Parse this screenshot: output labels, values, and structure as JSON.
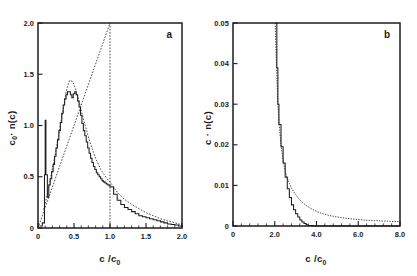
{
  "figure": {
    "background": "#ffffff",
    "ink_color": "#1c1c1c",
    "panels": [
      {
        "id": "panel-a",
        "label": "a",
        "xlabel_main": "c /c",
        "xlabel_sub": "0",
        "ylabel_main": "c",
        "ylabel_sub": "0",
        "ylabel_tail": "· n(c)",
        "xticks": [
          "0",
          "0.5",
          "1.0",
          "1.5",
          "2.0"
        ],
        "xtick_values": [
          0,
          0.5,
          1.0,
          1.5,
          2.0
        ],
        "yticks": [
          "0",
          "0.5",
          "1.0",
          "1.5",
          "2.0"
        ],
        "ytick_values": [
          0,
          0.5,
          1.0,
          1.5,
          2.0
        ],
        "xlim": [
          0,
          2.0
        ],
        "ylim": [
          0,
          2.0
        ]
      },
      {
        "id": "panel-b",
        "label": "b",
        "xlabel_main": "c /c",
        "xlabel_sub": "0",
        "ylabel_main": "c · n(c)",
        "xticks": [
          "0",
          "2.0",
          "4.0",
          "6.0",
          "8.0"
        ],
        "xtick_values": [
          0,
          2.0,
          4.0,
          6.0,
          8.0
        ],
        "yticks": [
          "0",
          "0.01",
          "0.02",
          "0.03",
          "0.04",
          "0.05"
        ],
        "ytick_values": [
          0,
          0.01,
          0.02,
          0.03,
          0.04,
          0.05
        ],
        "xlim": [
          0,
          8.0
        ],
        "ylim": [
          0,
          0.05
        ]
      }
    ]
  },
  "chart_data": [
    {
      "type": "line",
      "id": "panel-a",
      "title": "",
      "xlabel": "c / c0",
      "ylabel": "c0 · n(c)",
      "xlim": [
        0,
        2.0
      ],
      "ylim": [
        0,
        2.0
      ],
      "grid": false,
      "legend": "none",
      "annotations": [
        "a"
      ],
      "series": [
        {
          "name": "simulation histogram",
          "style": "solid-staircase",
          "x": [
            0.02,
            0.06,
            0.09,
            0.1,
            0.11,
            0.13,
            0.15,
            0.17,
            0.19,
            0.21,
            0.23,
            0.25,
            0.27,
            0.29,
            0.31,
            0.33,
            0.35,
            0.37,
            0.39,
            0.41,
            0.43,
            0.45,
            0.47,
            0.49,
            0.51,
            0.53,
            0.55,
            0.57,
            0.59,
            0.61,
            0.63,
            0.65,
            0.67,
            0.69,
            0.71,
            0.73,
            0.75,
            0.77,
            0.79,
            0.81,
            0.83,
            0.85,
            0.87,
            0.89,
            0.91,
            0.93,
            0.95,
            0.97,
            0.99,
            1.01,
            1.05,
            1.1,
            1.15,
            1.2,
            1.25,
            1.3,
            1.35,
            1.4,
            1.45,
            1.5,
            1.55,
            1.6,
            1.65,
            1.7,
            1.75,
            1.8,
            1.85,
            1.9,
            1.95,
            2.0
          ],
          "y": [
            0.02,
            0.05,
            0.52,
            1.05,
            0.52,
            0.3,
            0.42,
            0.48,
            0.55,
            0.62,
            0.7,
            0.78,
            0.86,
            0.95,
            1.03,
            1.12,
            1.2,
            1.26,
            1.3,
            1.33,
            1.33,
            1.3,
            1.27,
            1.31,
            1.33,
            1.3,
            1.24,
            1.18,
            1.1,
            1.02,
            0.95,
            0.9,
            0.84,
            0.78,
            0.73,
            0.68,
            0.64,
            0.6,
            0.57,
            0.54,
            0.52,
            0.5,
            0.48,
            0.46,
            0.45,
            0.44,
            0.43,
            0.42,
            0.41,
            0.4,
            0.33,
            0.27,
            0.23,
            0.2,
            0.18,
            0.16,
            0.14,
            0.12,
            0.11,
            0.1,
            0.09,
            0.08,
            0.07,
            0.06,
            0.05,
            0.04,
            0.035,
            0.03,
            0.02,
            0.01
          ]
        },
        {
          "name": "smooth distribution",
          "style": "dashed",
          "x": [
            0.08,
            0.12,
            0.16,
            0.2,
            0.24,
            0.28,
            0.32,
            0.36,
            0.4,
            0.44,
            0.48,
            0.52,
            0.56,
            0.6,
            0.64,
            0.68,
            0.72,
            0.76,
            0.8,
            0.84,
            0.88,
            0.92,
            0.96,
            1.0,
            1.05,
            1.1,
            1.2,
            1.3,
            1.4,
            1.5,
            1.6,
            1.7,
            1.8,
            1.9,
            2.0
          ],
          "y": [
            0.18,
            0.3,
            0.44,
            0.58,
            0.72,
            0.88,
            1.04,
            1.2,
            1.36,
            1.44,
            1.43,
            1.36,
            1.26,
            1.15,
            1.04,
            0.94,
            0.84,
            0.76,
            0.68,
            0.62,
            0.56,
            0.52,
            0.48,
            0.45,
            0.4,
            0.35,
            0.28,
            0.23,
            0.19,
            0.15,
            0.12,
            0.09,
            0.07,
            0.05,
            0.03
          ]
        },
        {
          "name": "theoretical ramp",
          "style": "dashed-triangle",
          "x": [
            0.0,
            1.0,
            1.0
          ],
          "y": [
            0.0,
            2.0,
            0.0
          ]
        }
      ]
    },
    {
      "type": "line",
      "id": "panel-b",
      "title": "",
      "xlabel": "c / c0",
      "ylabel": "c · n(c)",
      "xlim": [
        0,
        8.0
      ],
      "ylim": [
        0,
        0.05
      ],
      "grid": false,
      "legend": "none",
      "annotations": [
        "b"
      ],
      "series": [
        {
          "name": "simulation",
          "style": "solid",
          "x": [
            2.05,
            2.1,
            2.15,
            2.2,
            2.3,
            2.4,
            2.5,
            2.6,
            2.7,
            2.8,
            2.9,
            3.0,
            3.1,
            3.2,
            3.3,
            3.4,
            3.5,
            3.6,
            3.8,
            4.0,
            5.0,
            6.0,
            7.0,
            8.0
          ],
          "y": [
            0.05,
            0.039,
            0.03,
            0.025,
            0.0195,
            0.0155,
            0.012,
            0.0092,
            0.007,
            0.0052,
            0.004,
            0.003,
            0.0022,
            0.0015,
            0.001,
            0.0006,
            0.0003,
            0.0001,
            0.0,
            0.0,
            0.0,
            0.0,
            0.0,
            0.0
          ]
        },
        {
          "name": "theory",
          "style": "dashed",
          "x": [
            2.02,
            2.06,
            2.1,
            2.15,
            2.2,
            2.3,
            2.4,
            2.5,
            2.6,
            2.7,
            2.8,
            2.9,
            3.0,
            3.2,
            3.4,
            3.6,
            3.8,
            4.0,
            4.2,
            4.4,
            4.6,
            4.8,
            5.0,
            5.2,
            5.4,
            5.6,
            5.8,
            6.0,
            6.2,
            6.4,
            6.6,
            6.8,
            7.0,
            7.2,
            7.4,
            7.6,
            7.8,
            8.0
          ],
          "y": [
            0.05,
            0.043,
            0.037,
            0.03,
            0.0255,
            0.02,
            0.0163,
            0.0135,
            0.0118,
            0.0105,
            0.0094,
            0.0085,
            0.0077,
            0.0064,
            0.0055,
            0.0047,
            0.0041,
            0.0036,
            0.0032,
            0.0029,
            0.0026,
            0.0024,
            0.0022,
            0.0021,
            0.0019,
            0.0018,
            0.0017,
            0.0016,
            0.0015,
            0.0014,
            0.0014,
            0.0013,
            0.0013,
            0.0012,
            0.0012,
            0.0011,
            0.0011,
            0.0011
          ]
        }
      ]
    }
  ]
}
